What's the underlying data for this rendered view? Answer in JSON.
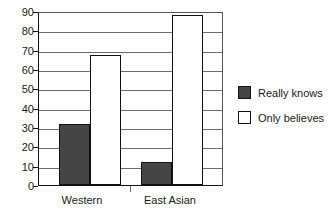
{
  "chart_data": {
    "type": "bar",
    "title": "",
    "subtitle": "",
    "xlabel": "",
    "ylabel": "",
    "categories": [
      "Western",
      "East Asian"
    ],
    "series": [
      {
        "name": "Really knows",
        "values": [
          32,
          12
        ],
        "color": "#454545",
        "swatch": "filled"
      },
      {
        "name": "Only believes",
        "values": [
          68,
          89
        ],
        "color": "#ffffff",
        "swatch": "hollow"
      }
    ],
    "ylim": [
      0,
      90
    ],
    "yticks": [
      0,
      10,
      20,
      30,
      40,
      50,
      60,
      70,
      80,
      90
    ],
    "ytick_labels": [
      "0",
      "10",
      "20",
      "30",
      "40",
      "50",
      "60",
      "70",
      "80",
      "90"
    ],
    "grid": true,
    "grid_axis": "y",
    "legend_position": "right",
    "background_color": "#ffffff",
    "axis_color": "#111111",
    "grid_color": "#6d6d6d"
  },
  "legend": {
    "items": [
      {
        "label": "Really knows",
        "swatch": "filled"
      },
      {
        "label": "Only believes",
        "swatch": "hollow"
      }
    ]
  },
  "axes": {
    "y_labels": [
      "90",
      "80",
      "70",
      "60",
      "50",
      "40",
      "30",
      "20",
      "10",
      "0"
    ],
    "x_labels": [
      "Western",
      "East Asian"
    ]
  }
}
